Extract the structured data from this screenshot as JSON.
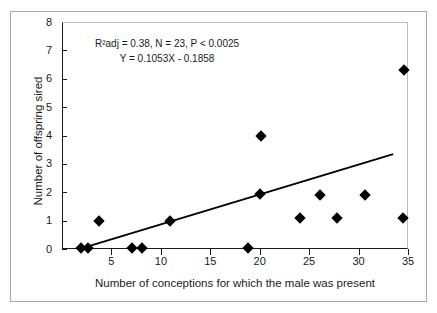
{
  "chart_data": {
    "type": "scatter",
    "title": "",
    "xlabel": "Number of conceptions for which the male was present",
    "ylabel": "Number of offspring sired",
    "xlim": [
      0,
      35
    ],
    "ylim": [
      0,
      8
    ],
    "xticks": [
      5,
      10,
      15,
      20,
      25,
      30,
      35
    ],
    "yticks": [
      0,
      1,
      2,
      3,
      4,
      5,
      6,
      7,
      8
    ],
    "xtick_labels": [
      "5",
      "10",
      "15",
      "20",
      "25",
      "30",
      "35"
    ],
    "ytick_labels": [
      "0",
      "1",
      "2",
      "3",
      "4",
      "5",
      "6",
      "7",
      "8"
    ],
    "grid": false,
    "legend": false,
    "marker": "diamond",
    "marker_color": "#000000",
    "points": [
      {
        "x": 1.9,
        "y": 0.05
      },
      {
        "x": 2.6,
        "y": 0.05
      },
      {
        "x": 3.7,
        "y": 1.0
      },
      {
        "x": 7.1,
        "y": 0.05
      },
      {
        "x": 8.1,
        "y": 0.05
      },
      {
        "x": 10.9,
        "y": 0.97
      },
      {
        "x": 18.8,
        "y": 0.05
      },
      {
        "x": 20.0,
        "y": 1.95
      },
      {
        "x": 20.1,
        "y": 4.0
      },
      {
        "x": 24.1,
        "y": 1.1
      },
      {
        "x": 26.1,
        "y": 1.92
      },
      {
        "x": 27.8,
        "y": 1.1
      },
      {
        "x": 30.7,
        "y": 1.9
      },
      {
        "x": 34.5,
        "y": 1.08
      },
      {
        "x": 34.6,
        "y": 6.32
      }
    ],
    "fit_line": {
      "slope": 0.1053,
      "intercept": -0.1858,
      "x_start": 2.3,
      "x_end": 33.5,
      "color": "#000000"
    },
    "annotations": [
      "R²adj = 0.38, N = 23, P < 0.0025",
      "Y = 0.1053X - 0.1858"
    ],
    "stats": {
      "r2adj": "0.38",
      "n": "23",
      "p": "< 0.0025",
      "equation": "Y = 0.1053X - 0.1858"
    }
  },
  "frame": {
    "border_color": "#a8a8a8",
    "axis_color": "#1a1a1a",
    "background": "#ffffff"
  }
}
